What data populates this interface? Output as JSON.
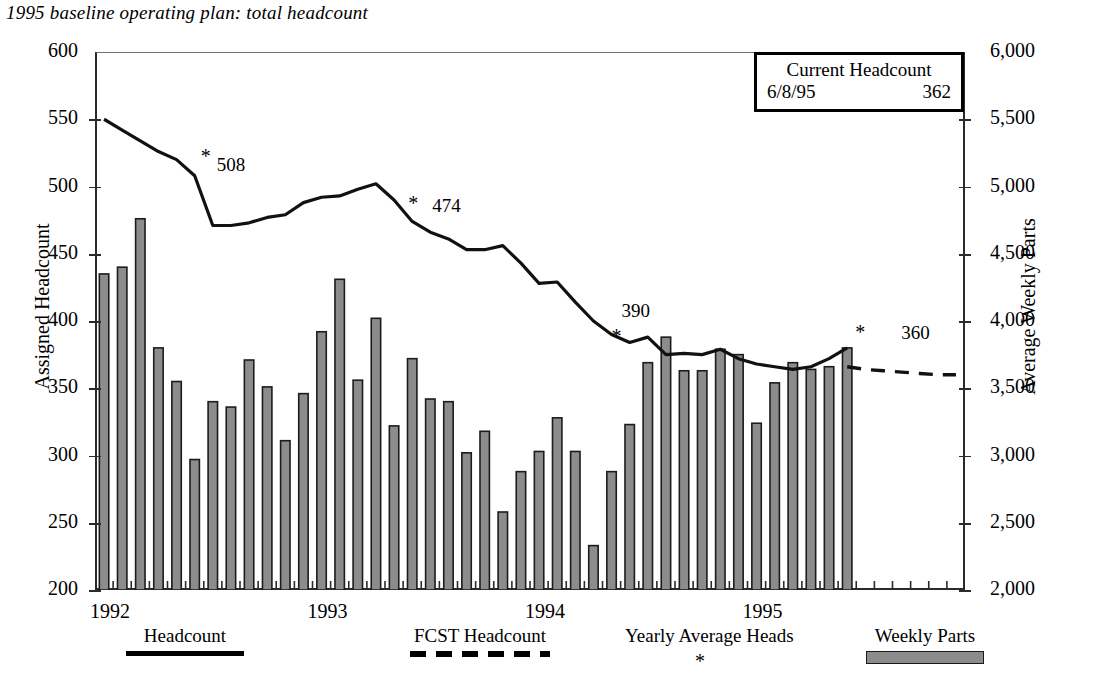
{
  "title": "1995 baseline operating plan: total headcount",
  "axes": {
    "left_title": "Assigned Headcount",
    "right_title": "Average Weekly Parts",
    "left_ticks": [
      "600",
      "550",
      "500",
      "450",
      "400",
      "350",
      "300",
      "250",
      "200"
    ],
    "right_ticks": [
      "6,000",
      "5,500",
      "5,000",
      "4,500",
      "4,000",
      "3,500",
      "3,000",
      "2,500",
      "2,000"
    ],
    "x_ticks": [
      "1992",
      "1993",
      "1994",
      "1995"
    ]
  },
  "callout": {
    "title": "Current Headcount",
    "date": "6/8/95",
    "value": "362"
  },
  "legend": [
    {
      "label": "Headcount",
      "marker": "solid-line"
    },
    {
      "label": "FCST Headcount",
      "marker": "dashed-line"
    },
    {
      "label": "Yearly Average Heads",
      "marker": "asterisk"
    },
    {
      "label": "Weekly Parts",
      "marker": "gray-bar"
    }
  ],
  "annotations": [
    {
      "text": "508",
      "star": "*"
    },
    {
      "text": "474",
      "star": "*"
    },
    {
      "text": "390",
      "star": "*"
    },
    {
      "text": "360",
      "star": "*"
    }
  ],
  "chart_data": {
    "type": "bar",
    "title": "1995 baseline operating plan: total headcount",
    "xlabel": "",
    "ylabel": "Assigned Headcount",
    "y2label": "Average Weekly Parts",
    "ylim": [
      200,
      600
    ],
    "y2lim": [
      2000,
      6000
    ],
    "grid": false,
    "legend_position": "bottom",
    "x_axis_type": "monthly from 1992-01 to 1995-06",
    "categories": [
      "1992-01",
      "1992-02",
      "1992-03",
      "1992-04",
      "1992-05",
      "1992-06",
      "1992-07",
      "1992-08",
      "1992-09",
      "1992-10",
      "1992-11",
      "1992-12",
      "1993-01",
      "1993-02",
      "1993-03",
      "1993-04",
      "1993-05",
      "1993-06",
      "1993-07",
      "1993-08",
      "1993-09",
      "1993-10",
      "1993-11",
      "1993-12",
      "1994-01",
      "1994-02",
      "1994-03",
      "1994-04",
      "1994-05",
      "1994-06",
      "1994-07",
      "1994-08",
      "1994-09",
      "1994-10",
      "1994-11",
      "1994-12",
      "1995-01",
      "1995-02",
      "1995-03",
      "1995-04",
      "1995-05",
      "1995-06"
    ],
    "series": [
      {
        "name": "Weekly Parts",
        "type": "bar",
        "axis": "right",
        "units": "average weekly parts",
        "values_headcount_scale": [
          435,
          440,
          476,
          380,
          355,
          297,
          340,
          336,
          371,
          351,
          311,
          346,
          392,
          431,
          356,
          402,
          322,
          372,
          342,
          340,
          302,
          318,
          258,
          288,
          303,
          328,
          303,
          233,
          288,
          323,
          369,
          388,
          363,
          363,
          379,
          375,
          324,
          354,
          369,
          364,
          366,
          380
        ],
        "values": [
          4350,
          4400,
          4760,
          3800,
          3550,
          2970,
          3400,
          3360,
          3710,
          3510,
          3110,
          3460,
          3920,
          4310,
          3560,
          4020,
          3220,
          3720,
          3420,
          3400,
          3020,
          3180,
          2580,
          2880,
          3030,
          3280,
          3030,
          2330,
          2880,
          3230,
          3690,
          3880,
          3630,
          3630,
          3790,
          3750,
          3240,
          3540,
          3690,
          3640,
          3660,
          3800
        ]
      },
      {
        "name": "Headcount",
        "type": "line",
        "axis": "left",
        "values": [
          550,
          542,
          534,
          526,
          520,
          508,
          471,
          471,
          473,
          477,
          479,
          488,
          492,
          493,
          498,
          502,
          490,
          474,
          466,
          461,
          453,
          453,
          456,
          443,
          428,
          429,
          414,
          400,
          390,
          384,
          388,
          375,
          376,
          375,
          379,
          372,
          368,
          366,
          364,
          366,
          372,
          380
        ]
      },
      {
        "name": "FCST Headcount",
        "type": "line-dashed",
        "axis": "left",
        "x": [
          "1995-06",
          "1995-07",
          "1995-08",
          "1995-09",
          "1995-10",
          "1995-11",
          "1995-12"
        ],
        "values": [
          366,
          364,
          363,
          362,
          361,
          360,
          360
        ]
      },
      {
        "name": "Yearly Average Heads",
        "type": "marker-asterisk",
        "axis": "left",
        "points": [
          {
            "x": "1992-06",
            "y": 508,
            "label": "508"
          },
          {
            "x": "1993-06",
            "y": 474,
            "label": "474"
          },
          {
            "x": "1994-05",
            "y": 390,
            "label": "390"
          },
          {
            "x": "1995-06",
            "y": 380,
            "label": "360"
          }
        ]
      }
    ]
  }
}
